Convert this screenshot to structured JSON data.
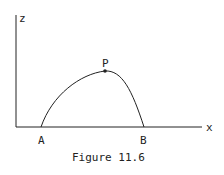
{
  "figure": {
    "caption": "Figure 11.6",
    "axes": {
      "vertical_label": "z",
      "horizontal_label": "x"
    },
    "points": {
      "start": "A",
      "end": "B",
      "peak": "P"
    },
    "colors": {
      "ink": "#222222",
      "background": "#ffffff"
    }
  }
}
